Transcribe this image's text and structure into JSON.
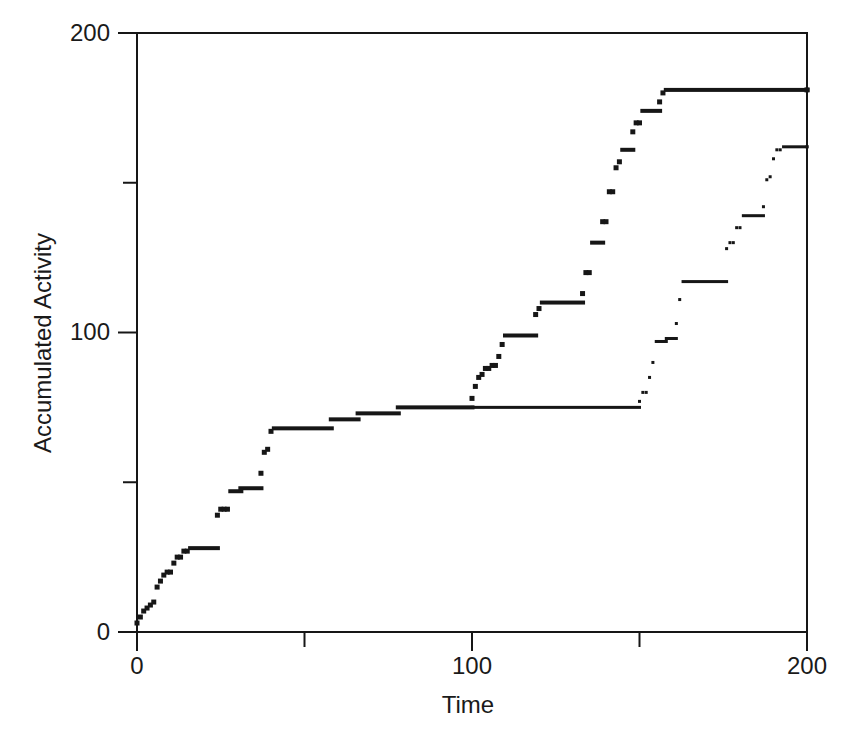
{
  "figure": {
    "background": "#ffffff",
    "ink_color": "#161616"
  },
  "axes": {
    "x": {
      "title": "Time",
      "tick_labels": [
        "0",
        "100",
        "200"
      ],
      "major_ticks": [
        0,
        100,
        200
      ],
      "minor_ticks": [
        50,
        150
      ]
    },
    "y": {
      "title": "Accumulated Activity",
      "tick_labels": [
        "0",
        "100",
        "200"
      ],
      "major_ticks": [
        0,
        100,
        200
      ],
      "minor_ticks": [
        50,
        150
      ]
    }
  },
  "chart_data": {
    "type": "scatter",
    "title": "",
    "xlabel": "Time",
    "ylabel": "Accumulated Activity",
    "xlim": [
      0,
      200
    ],
    "ylim": [
      0,
      200
    ],
    "x_ticks": [
      0,
      100,
      200
    ],
    "x_minor_ticks": [
      50,
      150
    ],
    "y_ticks": [
      0,
      100,
      200
    ],
    "y_minor_ticks": [
      50,
      150
    ],
    "grid": false,
    "legend": "none",
    "marker_color": "#161616",
    "series": [
      {
        "name": "trajectory-1",
        "style": "step-dots",
        "marker_size": 5,
        "line_thickness": 4,
        "steps": [
          [
            0,
            3
          ],
          [
            1,
            5
          ],
          [
            2,
            7
          ],
          [
            3,
            8
          ],
          [
            4,
            9
          ],
          [
            5,
            10
          ],
          [
            6,
            15
          ],
          [
            7,
            17
          ],
          [
            8,
            19
          ],
          [
            9,
            20
          ],
          [
            11,
            23
          ],
          [
            12,
            25
          ],
          [
            14,
            27
          ],
          [
            16,
            28
          ],
          [
            24,
            39
          ],
          [
            25,
            41
          ],
          [
            26,
            41
          ],
          [
            28,
            47
          ],
          [
            31,
            48
          ],
          [
            37,
            53
          ],
          [
            38,
            60
          ],
          [
            39,
            61
          ],
          [
            40,
            67
          ],
          [
            41,
            68
          ],
          [
            58,
            71
          ],
          [
            66,
            73
          ],
          [
            78,
            75
          ],
          [
            100,
            78
          ],
          [
            101,
            82
          ],
          [
            102,
            85
          ],
          [
            103,
            86
          ],
          [
            104,
            88
          ],
          [
            106,
            89
          ],
          [
            108,
            92
          ],
          [
            109,
            96
          ],
          [
            110,
            99
          ],
          [
            119,
            106
          ],
          [
            120,
            108
          ],
          [
            121,
            110
          ],
          [
            133,
            113
          ],
          [
            134,
            120
          ],
          [
            136,
            130
          ],
          [
            139,
            137
          ],
          [
            141,
            147
          ],
          [
            143,
            155
          ],
          [
            144,
            157
          ],
          [
            145,
            161
          ],
          [
            148,
            167
          ],
          [
            149,
            170
          ],
          [
            151,
            174
          ],
          [
            156,
            177
          ],
          [
            157,
            180
          ],
          [
            158,
            181
          ],
          [
            200,
            181
          ]
        ]
      },
      {
        "name": "trajectory-2",
        "style": "step-dots",
        "marker_size": 3,
        "line_thickness": 3,
        "steps": [
          [
            100,
            75
          ],
          [
            150,
            77
          ],
          [
            151,
            80
          ],
          [
            153,
            85
          ],
          [
            154,
            90
          ],
          [
            155,
            97
          ],
          [
            158,
            98
          ],
          [
            161,
            103
          ],
          [
            162,
            111
          ],
          [
            163,
            117
          ],
          [
            176,
            128
          ],
          [
            177,
            130
          ],
          [
            179,
            135
          ],
          [
            181,
            139
          ],
          [
            187,
            142
          ],
          [
            188,
            151
          ],
          [
            189,
            152
          ],
          [
            190,
            158
          ],
          [
            191,
            161
          ],
          [
            193,
            162
          ],
          [
            200,
            162
          ]
        ]
      }
    ]
  }
}
